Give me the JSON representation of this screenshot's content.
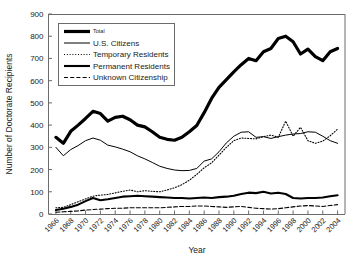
{
  "chart_data": {
    "type": "line",
    "title": "",
    "xlabel": "Year",
    "ylabel": "Number of Doctorate Recipients",
    "xlim": [
      1965,
      2005
    ],
    "ylim": [
      0,
      900
    ],
    "ytick_step": 100,
    "xtick_step": 2,
    "grid": false,
    "legend_position": "top-left",
    "yticks": [
      0,
      100,
      200,
      300,
      400,
      500,
      600,
      700,
      800,
      900
    ],
    "xticks": [
      1966,
      1968,
      1970,
      1972,
      1974,
      1976,
      1978,
      1980,
      1982,
      1984,
      1986,
      1988,
      1990,
      1992,
      1994,
      1996,
      1998,
      2000,
      2002,
      2004
    ],
    "x": [
      1966,
      1967,
      1968,
      1969,
      1970,
      1971,
      1972,
      1973,
      1974,
      1975,
      1976,
      1977,
      1978,
      1979,
      1980,
      1981,
      1982,
      1983,
      1984,
      1985,
      1986,
      1987,
      1988,
      1989,
      1990,
      1991,
      1992,
      1993,
      1994,
      1995,
      1996,
      1997,
      1998,
      1999,
      2000,
      2001,
      2002,
      2003,
      2004
    ],
    "series": [
      {
        "name": "Total",
        "style": "solid-thick",
        "color": "#000000",
        "width": 3.2,
        "values": [
          345,
          318,
          372,
          400,
          430,
          462,
          452,
          418,
          435,
          440,
          424,
          400,
          392,
          370,
          345,
          336,
          332,
          345,
          370,
          398,
          456,
          520,
          570,
          605,
          640,
          672,
          700,
          690,
          730,
          745,
          790,
          800,
          775,
          720,
          742,
          708,
          690,
          730,
          745
        ]
      },
      {
        "name": "U.S. Citizens",
        "style": "solid-thin",
        "color": "#000000",
        "width": 1.0,
        "values": [
          300,
          262,
          290,
          308,
          330,
          342,
          332,
          310,
          302,
          292,
          280,
          262,
          248,
          232,
          215,
          205,
          198,
          195,
          196,
          205,
          238,
          248,
          280,
          320,
          350,
          368,
          370,
          345,
          348,
          340,
          348,
          355,
          360,
          362,
          370,
          368,
          350,
          330,
          318
        ]
      },
      {
        "name": "Temporary Residents",
        "style": "dotted",
        "color": "#000000",
        "width": 1.1,
        "values": [
          28,
          30,
          42,
          55,
          68,
          80,
          85,
          88,
          95,
          102,
          108,
          100,
          105,
          102,
          100,
          108,
          118,
          132,
          152,
          178,
          208,
          230,
          265,
          300,
          330,
          342,
          340,
          338,
          348,
          355,
          345,
          418,
          350,
          390,
          330,
          318,
          328,
          352,
          382
        ]
      },
      {
        "name": "Permanent Residents",
        "style": "solid-medium",
        "color": "#000000",
        "width": 2.1,
        "values": [
          18,
          24,
          32,
          42,
          58,
          72,
          62,
          66,
          72,
          78,
          80,
          82,
          80,
          78,
          76,
          74,
          72,
          72,
          70,
          72,
          74,
          72,
          76,
          78,
          82,
          90,
          96,
          94,
          100,
          92,
          96,
          90,
          72,
          70,
          72,
          72,
          74,
          80,
          84
        ]
      },
      {
        "name": "Unknown Citizenship",
        "style": "dashed",
        "color": "#000000",
        "width": 1.1,
        "values": [
          8,
          10,
          12,
          14,
          18,
          20,
          22,
          24,
          26,
          26,
          28,
          28,
          28,
          28,
          28,
          30,
          32,
          34,
          34,
          36,
          36,
          34,
          32,
          30,
          32,
          34,
          30,
          26,
          24,
          22,
          24,
          28,
          32,
          36,
          38,
          36,
          34,
          38,
          42
        ]
      }
    ]
  },
  "legend": {
    "items": [
      {
        "label": "Total",
        "style": "solid-thick"
      },
      {
        "label": "U.S. Citizens",
        "style": "solid-thin"
      },
      {
        "label": "Temporary Residents",
        "style": "dotted"
      },
      {
        "label": "Permanent Residents",
        "style": "solid-medium"
      },
      {
        "label": "Unknown Citizenship",
        "style": "dashed"
      }
    ]
  },
  "axis": {
    "y_title": "Number of Doctorate Recipients",
    "x_title": "Year"
  },
  "colors": {
    "line": "#000000",
    "axis": "#6b6b6b",
    "text": "#1a1a1a",
    "background": "#ffffff"
  }
}
